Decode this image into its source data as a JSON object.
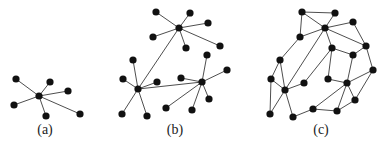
{
  "figure": {
    "node_radius": 3.6,
    "colors": {
      "node": "#111111",
      "edge": "#3a3a3a",
      "background": "#ffffff"
    },
    "panels": [
      {
        "id": "a",
        "label": "(a)",
        "label_pos": [
          45,
          136
        ],
        "nodes": [
          [
            39,
            96
          ],
          [
            16,
            79
          ],
          [
            50,
            82
          ],
          [
            68,
            91
          ],
          [
            14,
            105
          ],
          [
            46,
            116
          ],
          [
            80,
            114
          ]
        ],
        "edges": [
          [
            0,
            1
          ],
          [
            0,
            2
          ],
          [
            0,
            3
          ],
          [
            0,
            4
          ],
          [
            0,
            5
          ],
          [
            0,
            6
          ]
        ]
      },
      {
        "id": "b",
        "label": "(b)",
        "label_pos": [
          175,
          136
        ],
        "nodes": [
          [
            179,
            28
          ],
          [
            156,
            12
          ],
          [
            190,
            13
          ],
          [
            208,
            23
          ],
          [
            153,
            37
          ],
          [
            186,
            48
          ],
          [
            220,
            46
          ],
          [
            138,
            89
          ],
          [
            133,
            60
          ],
          [
            123,
            79
          ],
          [
            157,
            82
          ],
          [
            122,
            114
          ],
          [
            147,
            116
          ],
          [
            202,
            82
          ],
          [
            207,
            55
          ],
          [
            181,
            78
          ],
          [
            227,
            70
          ],
          [
            209,
            99
          ],
          [
            166,
            108
          ],
          [
            192,
            110
          ]
        ],
        "edges": [
          [
            0,
            1
          ],
          [
            0,
            2
          ],
          [
            0,
            3
          ],
          [
            0,
            4
          ],
          [
            0,
            5
          ],
          [
            0,
            6
          ],
          [
            0,
            7
          ],
          [
            7,
            8
          ],
          [
            7,
            9
          ],
          [
            7,
            10
          ],
          [
            7,
            11
          ],
          [
            7,
            12
          ],
          [
            7,
            13
          ],
          [
            13,
            14
          ],
          [
            13,
            15
          ],
          [
            13,
            16
          ],
          [
            13,
            17
          ],
          [
            13,
            18
          ],
          [
            13,
            19
          ]
        ]
      },
      {
        "id": "c",
        "label": "(c)",
        "label_pos": [
          321,
          136
        ],
        "nodes": [
          [
            302,
            12
          ],
          [
            335,
            13
          ],
          [
            325,
            28
          ],
          [
            353,
            22
          ],
          [
            300,
            37
          ],
          [
            366,
            46
          ],
          [
            332,
            48
          ],
          [
            353,
            55
          ],
          [
            280,
            60
          ],
          [
            373,
            70
          ],
          [
            271,
            79
          ],
          [
            285,
            90
          ],
          [
            304,
            83
          ],
          [
            328,
            79
          ],
          [
            347,
            83
          ],
          [
            355,
            100
          ],
          [
            270,
            114
          ],
          [
            293,
            117
          ],
          [
            313,
            109
          ],
          [
            337,
            111
          ]
        ],
        "edges": [
          [
            0,
            1
          ],
          [
            0,
            4
          ],
          [
            1,
            2
          ],
          [
            0,
            2
          ],
          [
            4,
            2
          ],
          [
            4,
            8
          ],
          [
            2,
            3
          ],
          [
            2,
            6
          ],
          [
            2,
            5
          ],
          [
            3,
            5
          ],
          [
            2,
            11
          ],
          [
            6,
            7
          ],
          [
            5,
            7
          ],
          [
            5,
            9
          ],
          [
            6,
            12
          ],
          [
            6,
            13
          ],
          [
            13,
            14
          ],
          [
            7,
            14
          ],
          [
            9,
            14
          ],
          [
            9,
            15
          ],
          [
            14,
            15
          ],
          [
            14,
            19
          ],
          [
            15,
            19
          ],
          [
            14,
            18
          ],
          [
            8,
            10
          ],
          [
            8,
            11
          ],
          [
            10,
            11
          ],
          [
            10,
            16
          ],
          [
            11,
            16
          ],
          [
            11,
            17
          ],
          [
            11,
            12
          ],
          [
            17,
            18
          ],
          [
            18,
            19
          ]
        ]
      }
    ]
  }
}
